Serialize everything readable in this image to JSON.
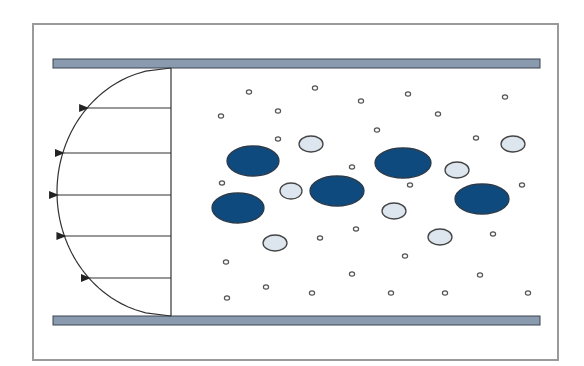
{
  "diagram": {
    "type": "laminar-flow-particle-suspension",
    "colors": {
      "background": "#ffffff",
      "frame": "#9a9a9a",
      "plate_fill": "#8a9bb0",
      "plate_stroke": "#3a4552",
      "profile_line": "#333333",
      "large_particle_fill": "#0e4a7e",
      "large_particle_stroke": "#2b3a4a",
      "medium_particle_fill": "#dde6ee",
      "medium_particle_stroke": "#444444",
      "small_particle_fill": "#ffffff",
      "small_particle_stroke": "#555555"
    },
    "frame": {
      "x": 33,
      "y": 24,
      "w": 525,
      "h": 336
    },
    "plates": [
      {
        "name": "top-plate",
        "x": 53,
        "y": 59,
        "w": 487,
        "h": 9
      },
      {
        "name": "bottom-plate",
        "x": 53,
        "y": 316,
        "w": 487,
        "h": 9
      }
    ],
    "velocity_profile": {
      "baseline_x": 171,
      "top_y": 68,
      "bottom_y": 316,
      "vertex_x": 57,
      "arrows_y": [
        108,
        153,
        195,
        236,
        278
      ]
    },
    "large_particles": [
      {
        "cx": 253,
        "cy": 161,
        "rx": 26,
        "ry": 15
      },
      {
        "cx": 238,
        "cy": 208,
        "rx": 26,
        "ry": 15
      },
      {
        "cx": 337,
        "cy": 191,
        "rx": 27,
        "ry": 15
      },
      {
        "cx": 403,
        "cy": 163,
        "rx": 28,
        "ry": 15
      },
      {
        "cx": 482,
        "cy": 199,
        "rx": 27,
        "ry": 15
      }
    ],
    "medium_particles": [
      {
        "cx": 311,
        "cy": 144,
        "rx": 12,
        "ry": 8
      },
      {
        "cx": 291,
        "cy": 191,
        "rx": 11,
        "ry": 8
      },
      {
        "cx": 394,
        "cy": 211,
        "rx": 12,
        "ry": 8
      },
      {
        "cx": 457,
        "cy": 170,
        "rx": 12,
        "ry": 8
      },
      {
        "cx": 513,
        "cy": 144,
        "rx": 12,
        "ry": 8
      },
      {
        "cx": 275,
        "cy": 243,
        "rx": 12,
        "ry": 8
      },
      {
        "cx": 440,
        "cy": 237,
        "rx": 12,
        "ry": 8
      }
    ],
    "small_particles": [
      [
        249,
        92
      ],
      [
        315,
        88
      ],
      [
        361,
        101
      ],
      [
        408,
        94
      ],
      [
        505,
        97
      ],
      [
        221,
        116
      ],
      [
        278,
        111
      ],
      [
        438,
        114
      ],
      [
        377,
        130
      ],
      [
        278,
        139
      ],
      [
        476,
        138
      ],
      [
        352,
        167
      ],
      [
        222,
        183
      ],
      [
        410,
        185
      ],
      [
        522,
        185
      ],
      [
        320,
        238
      ],
      [
        356,
        229
      ],
      [
        493,
        234
      ],
      [
        226,
        262
      ],
      [
        405,
        256
      ],
      [
        352,
        274
      ],
      [
        480,
        275
      ],
      [
        266,
        287
      ],
      [
        227,
        298
      ],
      [
        312,
        293
      ],
      [
        391,
        293
      ],
      [
        445,
        293
      ],
      [
        528,
        293
      ]
    ]
  }
}
